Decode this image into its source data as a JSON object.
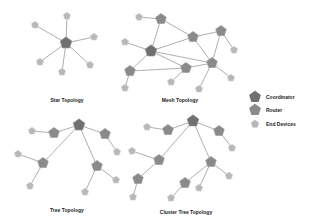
{
  "colors": {
    "coordinator": "#707070",
    "router": "#8a8a8a",
    "end_device": "#b8b8b8",
    "link": "#9a9a9a",
    "background": "#ffffff"
  },
  "legend": {
    "items": [
      {
        "label": "Coordinator",
        "type": "coordinator",
        "x": 255,
        "y": 97
      },
      {
        "label": "Router",
        "type": "router",
        "x": 255,
        "y": 110
      },
      {
        "label": "End Devices",
        "type": "end_device",
        "x": 255,
        "y": 124
      }
    ]
  },
  "topologies": [
    {
      "name": "star",
      "caption": "Star Topology",
      "caption_pos": [
        67,
        100
      ],
      "nodes": [
        {
          "id": "c",
          "type": "coordinator",
          "x": 66,
          "y": 43
        },
        {
          "id": "e1",
          "type": "end_device",
          "x": 67,
          "y": 16
        },
        {
          "id": "e2",
          "type": "end_device",
          "x": 35,
          "y": 25
        },
        {
          "id": "e3",
          "type": "end_device",
          "x": 94,
          "y": 37
        },
        {
          "id": "e4",
          "type": "end_device",
          "x": 40,
          "y": 62
        },
        {
          "id": "e5",
          "type": "end_device",
          "x": 90,
          "y": 65
        },
        {
          "id": "e6",
          "type": "end_device",
          "x": 62,
          "y": 72
        }
      ],
      "links": [
        [
          "c",
          "e1"
        ],
        [
          "c",
          "e2"
        ],
        [
          "c",
          "e3"
        ],
        [
          "c",
          "e4"
        ],
        [
          "c",
          "e5"
        ],
        [
          "c",
          "e6"
        ]
      ]
    },
    {
      "name": "mesh",
      "caption": "Mesh Topology",
      "caption_pos": [
        180,
        100
      ],
      "nodes": [
        {
          "id": "r1",
          "type": "router",
          "x": 161,
          "y": 19
        },
        {
          "id": "e1",
          "type": "end_device",
          "x": 139,
          "y": 17
        },
        {
          "id": "r2",
          "type": "router",
          "x": 193,
          "y": 37
        },
        {
          "id": "r3",
          "type": "router",
          "x": 221,
          "y": 31
        },
        {
          "id": "e2",
          "type": "end_device",
          "x": 234,
          "y": 50
        },
        {
          "id": "c",
          "type": "coordinator",
          "x": 151,
          "y": 51
        },
        {
          "id": "e3",
          "type": "end_device",
          "x": 125,
          "y": 42
        },
        {
          "id": "r4",
          "type": "router",
          "x": 212,
          "y": 63
        },
        {
          "id": "r5",
          "type": "router",
          "x": 186,
          "y": 68
        },
        {
          "id": "r6",
          "type": "router",
          "x": 130,
          "y": 71
        },
        {
          "id": "e4",
          "type": "end_device",
          "x": 231,
          "y": 78
        },
        {
          "id": "e5",
          "type": "end_device",
          "x": 171,
          "y": 82
        },
        {
          "id": "e6",
          "type": "end_device",
          "x": 125,
          "y": 88
        },
        {
          "id": "e7",
          "type": "end_device",
          "x": 199,
          "y": 89
        }
      ],
      "links": [
        [
          "e1",
          "r1"
        ],
        [
          "r1",
          "r2"
        ],
        [
          "r1",
          "c"
        ],
        [
          "r2",
          "r3"
        ],
        [
          "r3",
          "e2"
        ],
        [
          "r3",
          "r4"
        ],
        [
          "c",
          "e3"
        ],
        [
          "c",
          "r2"
        ],
        [
          "c",
          "r4"
        ],
        [
          "c",
          "r5"
        ],
        [
          "c",
          "r6"
        ],
        [
          "r2",
          "r4"
        ],
        [
          "r5",
          "r4"
        ],
        [
          "r6",
          "r5"
        ],
        [
          "r6",
          "e6"
        ],
        [
          "r5",
          "e5"
        ],
        [
          "r4",
          "e7"
        ],
        [
          "r4",
          "e4"
        ]
      ]
    },
    {
      "name": "tree",
      "caption": "Tree Topology",
      "caption_pos": [
        67,
        210
      ],
      "nodes": [
        {
          "id": "c",
          "type": "coordinator",
          "x": 79,
          "y": 125
        },
        {
          "id": "r1",
          "type": "router",
          "x": 54,
          "y": 133
        },
        {
          "id": "e1",
          "type": "end_device",
          "x": 32,
          "y": 131
        },
        {
          "id": "r2",
          "type": "router",
          "x": 105,
          "y": 134
        },
        {
          "id": "e2",
          "type": "end_device",
          "x": 117,
          "y": 152
        },
        {
          "id": "r3",
          "type": "router",
          "x": 43,
          "y": 163
        },
        {
          "id": "e3",
          "type": "end_device",
          "x": 18,
          "y": 154
        },
        {
          "id": "e4",
          "type": "end_device",
          "x": 30,
          "y": 186
        },
        {
          "id": "r4",
          "type": "router",
          "x": 97,
          "y": 166
        },
        {
          "id": "e5",
          "type": "end_device",
          "x": 116,
          "y": 180
        },
        {
          "id": "e6",
          "type": "end_device",
          "x": 85,
          "y": 192
        }
      ],
      "links": [
        [
          "e1",
          "r1"
        ],
        [
          "r1",
          "c"
        ],
        [
          "c",
          "r2"
        ],
        [
          "r2",
          "e2"
        ],
        [
          "c",
          "r3"
        ],
        [
          "r3",
          "e3"
        ],
        [
          "r3",
          "e4"
        ],
        [
          "c",
          "r4"
        ],
        [
          "r4",
          "e5"
        ],
        [
          "r4",
          "e6"
        ]
      ]
    },
    {
      "name": "cluster_tree",
      "caption": "Cluster Tree Topology",
      "caption_pos": [
        186,
        212
      ],
      "nodes": [
        {
          "id": "c",
          "type": "coordinator",
          "x": 193,
          "y": 121
        },
        {
          "id": "r1",
          "type": "router",
          "x": 168,
          "y": 130
        },
        {
          "id": "e1",
          "type": "end_device",
          "x": 147,
          "y": 127
        },
        {
          "id": "r2",
          "type": "router",
          "x": 219,
          "y": 131
        },
        {
          "id": "e2",
          "type": "end_device",
          "x": 232,
          "y": 148
        },
        {
          "id": "r3",
          "type": "router",
          "x": 159,
          "y": 160
        },
        {
          "id": "e3",
          "type": "end_device",
          "x": 132,
          "y": 151
        },
        {
          "id": "r4",
          "type": "router",
          "x": 138,
          "y": 179
        },
        {
          "id": "e4",
          "type": "end_device",
          "x": 133,
          "y": 197
        },
        {
          "id": "r5",
          "type": "router",
          "x": 211,
          "y": 162
        },
        {
          "id": "e5",
          "type": "end_device",
          "x": 229,
          "y": 176
        },
        {
          "id": "r6",
          "type": "router",
          "x": 185,
          "y": 183
        },
        {
          "id": "e6",
          "type": "end_device",
          "x": 199,
          "y": 188
        },
        {
          "id": "e7",
          "type": "end_device",
          "x": 171,
          "y": 198
        }
      ],
      "links": [
        [
          "e1",
          "r1"
        ],
        [
          "r1",
          "c"
        ],
        [
          "c",
          "r2"
        ],
        [
          "r2",
          "e2"
        ],
        [
          "c",
          "r3"
        ],
        [
          "r3",
          "e3"
        ],
        [
          "r3",
          "r4"
        ],
        [
          "r4",
          "e4"
        ],
        [
          "c",
          "r5"
        ],
        [
          "r5",
          "e5"
        ],
        [
          "r5",
          "r6"
        ],
        [
          "r5",
          "e6"
        ],
        [
          "r6",
          "e7"
        ]
      ]
    }
  ]
}
